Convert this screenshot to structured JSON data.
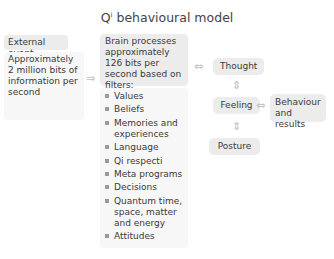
{
  "title": {
    "prefix": "Q",
    "sup": "i",
    "rest": " behavioural model"
  },
  "external": {
    "heading": "External event",
    "body": "Approximately 2 million bits of information per second"
  },
  "brain": {
    "heading": "Brain processes approximately 126 bits per second based on filters:",
    "filters": [
      "Values",
      "Beliefs",
      "Memories and experiences",
      "Language",
      "Qi respecti",
      "Meta programs",
      "Decisions",
      "Quantum time, space, matter and energy",
      "Attitudes"
    ]
  },
  "nodes": {
    "thought": "Thought",
    "feeling": "Feeling",
    "posture": "Posture",
    "behaviour": "Behaviour and results"
  },
  "arrows": {
    "right": "⇒",
    "both_h": "⇔",
    "both_v": "⇕"
  },
  "colors": {
    "box": "#ececec",
    "box_light": "#f7f7f7",
    "arrow": "#bdbdbd",
    "bullet": "#9a9a9a"
  }
}
